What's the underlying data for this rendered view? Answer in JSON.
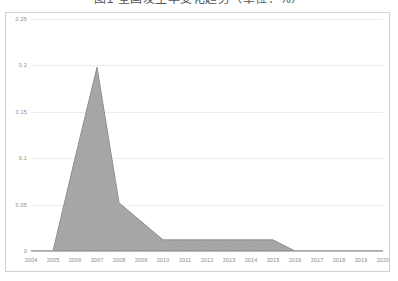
{
  "title": {
    "text": "图1  全国发生率变化趋势（单位：%）",
    "clipped": true
  },
  "chart_data": {
    "type": "area",
    "title": "图1  全国发生率变化趋势（单位：%）",
    "xlabel": "",
    "ylabel": "",
    "x": [
      2004,
      2005,
      2006,
      2007,
      2008,
      2009,
      2010,
      2011,
      2012,
      2013,
      2014,
      2015,
      2016,
      2017,
      2018,
      2019,
      2020
    ],
    "values": [
      0,
      0,
      0.1,
      0.198,
      0.052,
      0.032,
      0.012,
      0.012,
      0.012,
      0.012,
      0.012,
      0.012,
      0,
      0,
      0,
      0,
      0
    ],
    "categories": [
      "2004",
      "2005",
      "2006",
      "2007",
      "2008",
      "2009",
      "2010",
      "2011",
      "2012",
      "2013",
      "2014",
      "2015",
      "2016",
      "2017",
      "2018",
      "2019",
      "2020"
    ],
    "xlim": [
      2004,
      2020
    ],
    "ylim": [
      0,
      0.25
    ],
    "yticks": [
      0,
      0.05,
      0.1,
      0.15,
      0.2,
      0.25
    ],
    "ytick_labels": [
      "0",
      "0.05",
      "0.1",
      "0.15",
      "0.2",
      "0.25"
    ],
    "xtick_labels": [
      "2004",
      "2005",
      "2006",
      "2007",
      "2008",
      "2009",
      "2010",
      "2011",
      "2012",
      "2013",
      "2014",
      "2015",
      "2016",
      "2017",
      "2018",
      "2019",
      "2020"
    ],
    "grid": true,
    "legend": null,
    "series_fill_color": "#a8a8a8",
    "series_line_color": "#8f8f8f",
    "grid_color": "#ececec",
    "axis_color": "#b9b9b9",
    "tick_label_color": "#8a8a8a",
    "frame_color": "#d2d2d2",
    "background": "#ffffff",
    "peak": {
      "x": 2007,
      "y": 0.198
    }
  }
}
